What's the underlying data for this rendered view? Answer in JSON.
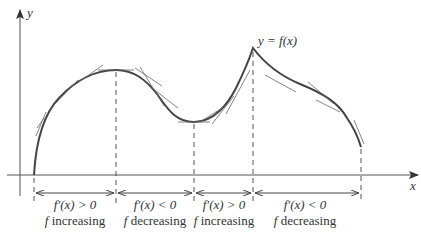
{
  "figure": {
    "axis_labels": {
      "x": "x",
      "y": "y"
    },
    "curve_label": "y = f(x)",
    "colors": {
      "axis": "#555555",
      "curve": "#444444",
      "tangent": "#666666",
      "dashed": "#555555",
      "text": "#333333"
    },
    "critical_x_pixels": [
      34,
      116,
      194,
      253,
      361
    ],
    "intervals": [
      {
        "derivative": "f′(x) > 0",
        "behavior": "f increasing",
        "f": "f",
        "word": "increasing"
      },
      {
        "derivative": "f′(x) < 0",
        "behavior": "f decreasing",
        "f": "f",
        "word": "decreasing"
      },
      {
        "derivative": "f′(x) > 0",
        "behavior": "f increasing",
        "f": "f",
        "word": "increasing"
      },
      {
        "derivative": "f′(x) < 0",
        "behavior": "f decreasing",
        "f": "f",
        "word": "decreasing"
      }
    ]
  }
}
